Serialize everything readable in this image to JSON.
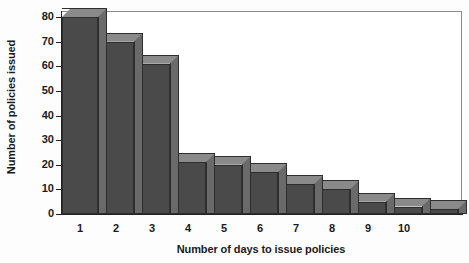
{
  "chart_data": {
    "type": "bar",
    "title": "",
    "xlabel": "Number of days to issue policies",
    "ylabel": "Number of policies issued",
    "categories": [
      "1",
      "2",
      "3",
      "4",
      "5",
      "6",
      "7",
      "8",
      "9",
      "10",
      ""
    ],
    "values": [
      80,
      70,
      61,
      21,
      20,
      17,
      12,
      10,
      5,
      3,
      2
    ],
    "ylim": [
      0,
      80
    ],
    "yticks": [
      0,
      10,
      20,
      30,
      40,
      50,
      60,
      70,
      80
    ],
    "ytick_labels": [
      "0",
      "10",
      "20",
      "30",
      "40",
      "50",
      "60",
      "70",
      "80"
    ],
    "xtick_labels": [
      "1",
      "2",
      "3",
      "4",
      "5",
      "6",
      "7",
      "8",
      "9",
      "10"
    ],
    "grid": false,
    "legend": false,
    "style": "3d-histogram",
    "colors": {
      "bar_front": "#4a4a4a",
      "bar_top": "#8a8a8a",
      "bar_side": "#6a6a6a",
      "bar_edge": "#2e2e2e",
      "axis": "#222222",
      "frame": "#8b8b8b",
      "background": "#ffffff",
      "text": "#1a1a1a"
    }
  }
}
